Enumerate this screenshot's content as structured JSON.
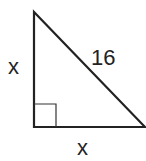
{
  "diagram": {
    "type": "right-triangle",
    "labels": {
      "left_leg": "x",
      "hypotenuse": "16",
      "bottom_leg": "x"
    },
    "right_angle_marker": true,
    "stroke_color": "#222222"
  }
}
